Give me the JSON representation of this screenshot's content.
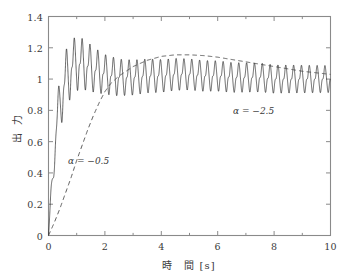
{
  "figure": {
    "background_color": "#ffffff",
    "frame_color": "#8a8a8a",
    "text_color": "#3a3a3a"
  },
  "axes": {
    "xlabel": "時　間 [s]",
    "ylabel": "出 力",
    "x_ticks": [
      "0",
      "2",
      "4",
      "6",
      "8",
      "10"
    ],
    "y_ticks": [
      "0",
      "0.2",
      "0.4",
      "0.6",
      "0.8",
      "1",
      "1.2",
      "1.4"
    ]
  },
  "annotations": [
    {
      "text": "α = −2.5",
      "x": 7.2,
      "y": 0.82
    },
    {
      "text": "α = −0.5",
      "x": 1.15,
      "y": 0.45
    }
  ],
  "chart_data": {
    "type": "line",
    "title": "",
    "xlabel": "時　間 [s]",
    "ylabel": "出 力",
    "xlim": [
      0,
      10
    ],
    "ylim": [
      0,
      1.4
    ],
    "xticks": [
      0,
      2,
      4,
      6,
      8,
      10
    ],
    "yticks": [
      0,
      0.2,
      0.4,
      0.6,
      0.8,
      1.0,
      1.2,
      1.4
    ],
    "x_minor_ticks": [
      1,
      3,
      5,
      7,
      9
    ],
    "y_minor_ticks": [],
    "grid": false,
    "legend": "none",
    "legend_position": "inline-annotations",
    "series": [
      {
        "name": "α = −2.5",
        "style": "solid",
        "color": "#000000",
        "linewidth": 0.6,
        "description": "Fast rise with large overshoot then persistent high-frequency oscillation settling near 1.0",
        "oscillation": {
          "frequency_hz": 3.6,
          "mean_curve_x": [
            0,
            0.1,
            0.2,
            0.3,
            0.45,
            0.6,
            0.8,
            1.0,
            1.3,
            1.6,
            2.0,
            2.5,
            3.0,
            3.5,
            4.0,
            4.5,
            5.0,
            5.5,
            6.0,
            6.5,
            7.0,
            7.5,
            8.0,
            8.5,
            9.0,
            9.5,
            10.0
          ],
          "mean_curve_y": [
            0.0,
            0.26,
            0.52,
            0.72,
            0.89,
            0.99,
            1.07,
            1.1,
            1.09,
            1.06,
            1.03,
            1.01,
            1.01,
            1.02,
            1.02,
            1.03,
            1.03,
            1.02,
            1.02,
            1.01,
            1.01,
            1.01,
            1.0,
            1.0,
            1.0,
            1.0,
            1.0
          ],
          "envelope_x": [
            0,
            0.15,
            0.3,
            0.5,
            0.7,
            0.9,
            1.2,
            1.6,
            2.0,
            2.6,
            3.2,
            4.0,
            5.0,
            6.0,
            7.0,
            8.0,
            9.0,
            10.0
          ],
          "envelope_y": [
            0.02,
            0.09,
            0.14,
            0.17,
            0.17,
            0.16,
            0.15,
            0.13,
            0.115,
            0.105,
            0.1,
            0.095,
            0.09,
            0.088,
            0.085,
            0.082,
            0.08,
            0.078
          ]
        },
        "peak_value": 1.26,
        "peak_time": 0.85,
        "steady_state": 1.0
      },
      {
        "name": "α = −0.5",
        "style": "dashed",
        "color": "#4a4a4a",
        "linewidth": 0.9,
        "description": "Slow smooth rise, mild hump above unity, gradual return toward 1.0",
        "x": [
          0,
          0.2,
          0.4,
          0.6,
          0.8,
          1.0,
          1.2,
          1.4,
          1.6,
          1.8,
          2.0,
          2.2,
          2.5,
          3.0,
          3.5,
          4.0,
          4.5,
          5.0,
          5.5,
          6.0,
          6.5,
          7.0,
          7.5,
          8.0,
          8.5,
          9.0,
          9.5,
          10.0
        ],
        "y": [
          0.0,
          0.08,
          0.17,
          0.27,
          0.37,
          0.48,
          0.58,
          0.68,
          0.77,
          0.85,
          0.92,
          0.97,
          1.02,
          1.08,
          1.12,
          1.145,
          1.155,
          1.155,
          1.15,
          1.14,
          1.125,
          1.11,
          1.095,
          1.08,
          1.065,
          1.05,
          1.04,
          1.03
        ],
        "peak_value": 1.155,
        "peak_time": 4.7,
        "steady_state": 1.0
      }
    ]
  }
}
